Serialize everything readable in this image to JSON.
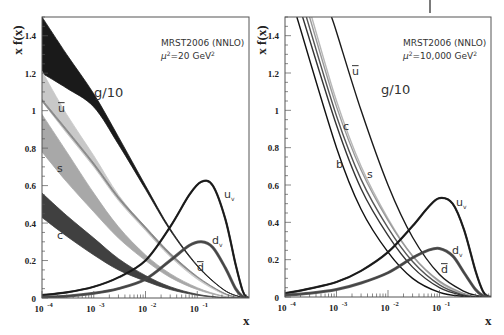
{
  "chart_data": [
    {
      "type": "line",
      "panel": "left",
      "title": "",
      "annotation": [
        "MRST2006 (NNLO)",
        "μ²=20 GeV²"
      ],
      "annotation_line1": "MRST2006 (NNLO)",
      "annotation_mu": "μ",
      "annotation_sup": "2",
      "annotation_rest": "=20 GeV",
      "annotation_unit_sup": "2",
      "xlabel": "x",
      "ylabel": "x f(x)",
      "xscale": "log",
      "xlim": [
        0.0001,
        1
      ],
      "ylim": [
        0,
        1.5
      ],
      "xticks": [
        "10-4",
        "10-3",
        "10-2",
        "10-1"
      ],
      "xtick_bases": [
        "10",
        "10",
        "10",
        "10"
      ],
      "xtick_exps": [
        "-4",
        "-3",
        "-2",
        "-1"
      ],
      "yticks": [
        "0",
        "0.2",
        "0.4",
        "0.6",
        "0.8",
        "1",
        "1.2",
        "1.4"
      ],
      "grid": false,
      "series": [
        {
          "name": "g/10",
          "label": "g/10",
          "style": "band",
          "color": "#1a1a1a",
          "x": [
            0.0001,
            0.0003,
            0.001,
            0.003,
            0.01,
            0.03,
            0.1,
            0.3,
            0.6,
            1.0
          ],
          "lower": [
            1.2,
            1.12,
            1.02,
            0.82,
            0.58,
            0.36,
            0.17,
            0.05,
            0.01,
            0.0
          ],
          "upper": [
            1.5,
            1.3,
            1.09,
            0.86,
            0.6,
            0.37,
            0.175,
            0.052,
            0.01,
            0.0
          ]
        },
        {
          "name": "ubar",
          "label": "u̅",
          "style": "band",
          "color": "#c8c8c8",
          "x": [
            0.0001,
            0.0003,
            0.001,
            0.003,
            0.01,
            0.03,
            0.1,
            0.3,
            0.6,
            1.0
          ],
          "lower": [
            1.05,
            0.88,
            0.7,
            0.52,
            0.36,
            0.22,
            0.1,
            0.025,
            0.003,
            0.0
          ],
          "upper": [
            1.21,
            0.98,
            0.76,
            0.55,
            0.375,
            0.23,
            0.105,
            0.027,
            0.003,
            0.0
          ]
        },
        {
          "name": "dbar",
          "label": "d̅",
          "style": "band",
          "color": "#888888",
          "x": [
            0.0001,
            0.0003,
            0.001,
            0.003,
            0.01,
            0.03,
            0.1,
            0.3,
            0.6,
            1.0
          ],
          "lower": [
            1.05,
            0.89,
            0.71,
            0.53,
            0.37,
            0.23,
            0.11,
            0.03,
            0.003,
            0.0
          ],
          "upper": [
            1.06,
            0.9,
            0.72,
            0.54,
            0.38,
            0.24,
            0.115,
            0.032,
            0.003,
            0.0
          ]
        },
        {
          "name": "s",
          "label": "s",
          "style": "band",
          "color": "#a8a8a8",
          "x": [
            0.0001,
            0.0003,
            0.001,
            0.003,
            0.01,
            0.03,
            0.1,
            0.3,
            0.6,
            1.0
          ],
          "lower": [
            0.78,
            0.62,
            0.46,
            0.32,
            0.2,
            0.11,
            0.045,
            0.01,
            0.001,
            0.0
          ],
          "upper": [
            0.98,
            0.78,
            0.56,
            0.38,
            0.23,
            0.13,
            0.055,
            0.012,
            0.001,
            0.0
          ]
        },
        {
          "name": "c",
          "label": "c",
          "style": "band",
          "color": "#404040",
          "x": [
            0.0001,
            0.0003,
            0.001,
            0.003,
            0.01,
            0.03,
            0.1,
            0.3,
            0.6,
            1.0
          ],
          "lower": [
            0.43,
            0.33,
            0.23,
            0.15,
            0.09,
            0.045,
            0.015,
            0.002,
            0.0,
            0.0
          ],
          "upper": [
            0.56,
            0.44,
            0.32,
            0.21,
            0.12,
            0.06,
            0.02,
            0.003,
            0.0,
            0.0
          ]
        },
        {
          "name": "u_v",
          "label": "u",
          "label_sub": "v",
          "style": "line",
          "color": "#1a1a1a",
          "x": [
            0.0001,
            0.0003,
            0.001,
            0.003,
            0.01,
            0.03,
            0.07,
            0.12,
            0.2,
            0.35,
            0.55,
            0.75,
            0.9,
            1.0
          ],
          "y": [
            0.015,
            0.03,
            0.06,
            0.11,
            0.2,
            0.38,
            0.55,
            0.62,
            0.6,
            0.42,
            0.18,
            0.04,
            0.005,
            0.0
          ]
        },
        {
          "name": "d_v",
          "label": "d",
          "label_sub": "v",
          "style": "line",
          "color": "#444444",
          "x": [
            0.0001,
            0.0003,
            0.001,
            0.003,
            0.01,
            0.03,
            0.07,
            0.12,
            0.2,
            0.35,
            0.55,
            0.75,
            0.9,
            1.0
          ],
          "y": [
            0.005,
            0.01,
            0.025,
            0.05,
            0.1,
            0.2,
            0.28,
            0.3,
            0.27,
            0.16,
            0.05,
            0.008,
            0.001,
            0.0
          ]
        }
      ]
    },
    {
      "type": "line",
      "panel": "right",
      "title": "",
      "annotation": [
        "MRST2006 (NNLO)",
        "μ²=10,000 GeV²"
      ],
      "annotation_line1": "MRST2006 (NNLO)",
      "annotation_mu": "μ",
      "annotation_sup": "2",
      "annotation_rest": "=10,000 GeV",
      "annotation_unit_sup": "2",
      "xlabel": "x",
      "ylabel": "x f(x)",
      "xscale": "log",
      "xlim": [
        0.0001,
        1
      ],
      "ylim": [
        0,
        1.5
      ],
      "xticks": [
        "10-4",
        "10-3",
        "10-2",
        "10-1"
      ],
      "xtick_bases": [
        "10",
        "10",
        "10",
        "10"
      ],
      "xtick_exps": [
        "-4",
        "-3",
        "-2",
        "-1"
      ],
      "yticks": [
        "0",
        "0.2",
        "0.4",
        "0.6",
        "0.8",
        "1",
        "1.2",
        "1.4"
      ],
      "grid": false,
      "series": [
        {
          "name": "g/10",
          "label": "g/10",
          "style": "line",
          "color": "#1a1a1a",
          "x": [
            0.0008,
            0.001,
            0.003,
            0.01,
            0.03,
            0.1,
            0.3,
            0.6,
            1.0
          ],
          "y": [
            1.5,
            1.42,
            1.0,
            0.6,
            0.32,
            0.12,
            0.03,
            0.004,
            0.0
          ]
        },
        {
          "name": "ubar",
          "label": "u̅",
          "style": "line",
          "color": "#b8b8b8",
          "x": [
            0.00033,
            0.001,
            0.003,
            0.01,
            0.03,
            0.1,
            0.3,
            0.6,
            1.0
          ],
          "y": [
            1.5,
            1.05,
            0.7,
            0.42,
            0.22,
            0.08,
            0.015,
            0.001,
            0.0
          ]
        },
        {
          "name": "dbar",
          "label": "d̅",
          "style": "line",
          "color": "#999999",
          "x": [
            0.0003,
            0.001,
            0.003,
            0.01,
            0.03,
            0.1,
            0.3,
            0.6,
            1.0
          ],
          "y": [
            1.5,
            1.02,
            0.68,
            0.41,
            0.22,
            0.085,
            0.018,
            0.001,
            0.0
          ]
        },
        {
          "name": "s",
          "label": "s",
          "style": "line",
          "color": "#555555",
          "x": [
            0.00026,
            0.001,
            0.003,
            0.01,
            0.03,
            0.1,
            0.3,
            0.6,
            1.0
          ],
          "y": [
            1.5,
            0.97,
            0.63,
            0.37,
            0.19,
            0.065,
            0.01,
            0.0,
            0.0
          ]
        },
        {
          "name": "c",
          "label": "c",
          "style": "line",
          "color": "#333333",
          "x": [
            0.00022,
            0.001,
            0.003,
            0.01,
            0.03,
            0.1,
            0.3,
            0.6,
            1.0
          ],
          "y": [
            1.5,
            0.92,
            0.58,
            0.33,
            0.16,
            0.05,
            0.007,
            0.0,
            0.0
          ]
        },
        {
          "name": "b",
          "label": "b",
          "style": "line",
          "color": "#111111",
          "x": [
            0.00017,
            0.001,
            0.003,
            0.01,
            0.03,
            0.1,
            0.3,
            0.6,
            1.0
          ],
          "y": [
            1.5,
            0.8,
            0.47,
            0.24,
            0.1,
            0.025,
            0.003,
            0.0,
            0.0
          ]
        },
        {
          "name": "u_v",
          "label": "u",
          "label_sub": "v",
          "style": "line",
          "color": "#1a1a1a",
          "x": [
            0.0001,
            0.0003,
            0.001,
            0.003,
            0.01,
            0.03,
            0.06,
            0.1,
            0.18,
            0.3,
            0.5,
            0.7,
            0.9,
            1.0
          ],
          "y": [
            0.02,
            0.045,
            0.08,
            0.14,
            0.24,
            0.38,
            0.48,
            0.53,
            0.5,
            0.36,
            0.14,
            0.03,
            0.002,
            0.0
          ]
        },
        {
          "name": "d_v",
          "label": "d",
          "label_sub": "v",
          "style": "line",
          "color": "#444444",
          "x": [
            0.0001,
            0.0003,
            0.001,
            0.003,
            0.01,
            0.03,
            0.06,
            0.1,
            0.18,
            0.3,
            0.5,
            0.7,
            0.9,
            1.0
          ],
          "y": [
            0.01,
            0.02,
            0.04,
            0.075,
            0.13,
            0.21,
            0.25,
            0.26,
            0.22,
            0.13,
            0.04,
            0.006,
            0.0,
            0.0
          ]
        }
      ]
    }
  ],
  "panels": [
    {
      "frame": {
        "left": 42,
        "top": 17,
        "right": 249,
        "bottom": 298
      },
      "ylabel_pos": {
        "x": 14,
        "y": 30
      },
      "xlabel_pos": {
        "x": 243,
        "y": 325
      },
      "annotation_pos": {
        "x": 161,
        "y": 46
      },
      "labels": [
        {
          "text": "g/10",
          "x": 94,
          "y": 97,
          "size": 13,
          "overline": false
        },
        {
          "text": "u",
          "x": 58,
          "y": 112,
          "size": 11,
          "overline": true
        },
        {
          "text": "s",
          "x": 57,
          "y": 172,
          "size": 11,
          "overline": false
        },
        {
          "text": "c",
          "x": 57,
          "y": 239,
          "size": 11,
          "overline": false
        },
        {
          "text": "u",
          "sub": "v",
          "x": 224,
          "y": 198,
          "size": 11,
          "overline": false
        },
        {
          "text": "d",
          "sub": "v",
          "x": 212,
          "y": 244,
          "size": 11,
          "overline": false
        },
        {
          "text": "d",
          "x": 197,
          "y": 271,
          "size": 11,
          "overline": true
        }
      ]
    },
    {
      "frame": {
        "left": 285,
        "top": 17,
        "right": 491,
        "bottom": 297
      },
      "ylabel_pos": {
        "x": 258,
        "y": 30
      },
      "xlabel_pos": {
        "x": 485,
        "y": 325
      },
      "annotation_pos": {
        "x": 403,
        "y": 46
      },
      "labels": [
        {
          "text": "g/10",
          "x": 381,
          "y": 94,
          "size": 13,
          "overline": false
        },
        {
          "text": "u",
          "x": 352,
          "y": 75,
          "size": 11,
          "overline": true
        },
        {
          "text": "c",
          "x": 343,
          "y": 130,
          "size": 11,
          "overline": false
        },
        {
          "text": "b",
          "x": 336,
          "y": 168,
          "size": 11,
          "overline": false
        },
        {
          "text": "s",
          "x": 367,
          "y": 178,
          "size": 11,
          "overline": false
        },
        {
          "text": "u",
          "sub": "v",
          "x": 456,
          "y": 206,
          "size": 11,
          "overline": false
        },
        {
          "text": "d",
          "sub": "v",
          "x": 452,
          "y": 254,
          "size": 11,
          "overline": false
        },
        {
          "text": "d",
          "x": 441,
          "y": 273,
          "size": 11,
          "overline": true
        }
      ]
    }
  ],
  "top_tick": {
    "x": 430,
    "y1": 0,
    "y2": 13
  }
}
